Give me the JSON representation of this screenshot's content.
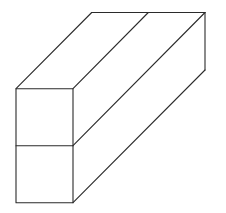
{
  "figure": {
    "stroke_color": "#2b2b2b",
    "background": "#ffffff",
    "front_face": {
      "left": 16,
      "right": 73,
      "top": 88.7,
      "middle": 145.7,
      "bottom": 202.7
    },
    "back_top_edge": {
      "y": 12.5,
      "x_left": 91.7,
      "x_mid": 148.3,
      "x_right": 205
    },
    "back_right_edge": {
      "x": 205,
      "y_top": 12.5,
      "y_bottom": 70
    }
  }
}
